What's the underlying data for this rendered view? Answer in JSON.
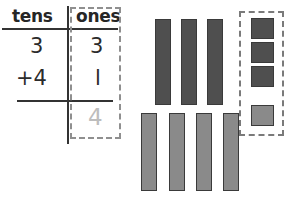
{
  "worksheet": {
    "type": "place-value-addition",
    "table": {
      "columns": [
        {
          "key": "tens",
          "label": "tens"
        },
        {
          "key": "ones",
          "label": "ones"
        }
      ],
      "rows": [
        {
          "tens": "3",
          "ones": "3"
        },
        {
          "tens": "+4",
          "ones": "l"
        }
      ],
      "sum": {
        "tens": "",
        "ones": "4"
      },
      "highlighted_column": "ones",
      "answer_color": "#bdbdbd"
    },
    "blocks": {
      "ten_rods": {
        "dark": {
          "count": 3,
          "color": "#4f4f4f"
        },
        "light": {
          "count": 4,
          "color": "#8a8a8a"
        }
      },
      "unit_cubes": {
        "dark": {
          "count": 3,
          "color": "#4f4f4f"
        },
        "light": {
          "count": 1,
          "color": "#8a8a8a"
        },
        "highlighted": true
      },
      "outline_color": "#3a3a3a",
      "dash_color": "#7a7a7a"
    }
  }
}
